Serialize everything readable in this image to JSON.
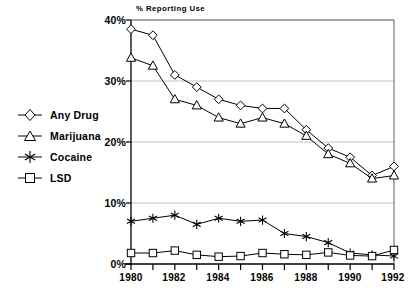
{
  "chart_data": {
    "type": "line",
    "title": "% Reporting Use",
    "xlabel": "",
    "ylabel": "",
    "x": [
      1980,
      1981,
      1982,
      1983,
      1984,
      1985,
      1986,
      1987,
      1988,
      1989,
      1990,
      1991,
      1992
    ],
    "xtick_labels": [
      "1980",
      "1982",
      "1984",
      "1986",
      "1988",
      "1990",
      "1992"
    ],
    "xtick_values": [
      1980,
      1982,
      1984,
      1986,
      1988,
      1990,
      1992
    ],
    "ytick_labels": [
      "0%",
      "10%",
      "20%",
      "30%",
      "40%"
    ],
    "ytick_values": [
      0,
      10,
      20,
      30,
      40
    ],
    "xlim": [
      1980,
      1992
    ],
    "ylim": [
      0,
      40
    ],
    "grid": true,
    "legend_position": "left-outside",
    "series": [
      {
        "name": "Any Drug",
        "marker": "diamond",
        "values": [
          38.5,
          37.5,
          31.0,
          29.0,
          27.0,
          26.0,
          25.5,
          25.5,
          22.0,
          19.0,
          17.5,
          14.5,
          16.0
        ]
      },
      {
        "name": "Marijuana",
        "marker": "triangle",
        "values": [
          33.8,
          32.5,
          27.0,
          26.0,
          24.0,
          23.0,
          24.0,
          23.0,
          21.0,
          18.0,
          16.5,
          14.0,
          14.5
        ]
      },
      {
        "name": "Cocaine",
        "marker": "asterisk",
        "values": [
          7.0,
          7.5,
          8.0,
          6.5,
          7.5,
          7.0,
          7.2,
          5.0,
          4.5,
          3.5,
          1.8,
          1.5,
          1.3
        ]
      },
      {
        "name": "LSD",
        "marker": "square",
        "values": [
          1.8,
          1.8,
          2.2,
          1.5,
          1.2,
          1.3,
          1.8,
          1.6,
          1.5,
          1.9,
          1.4,
          1.3,
          2.3
        ]
      }
    ]
  },
  "legend": {
    "items": [
      {
        "label": "Any Drug"
      },
      {
        "label": "Marijuana"
      },
      {
        "label": "Cocaine"
      },
      {
        "label": "LSD"
      }
    ]
  },
  "axes": {
    "y_labels": [
      "40%",
      "30%",
      "20%",
      "10%",
      "0%"
    ],
    "x_labels": [
      "1980",
      "1982",
      "1984",
      "1986",
      "1988",
      "1990",
      "1992"
    ]
  },
  "colors": {
    "line": "#000000",
    "grid": "#b4b4b4",
    "frame": "#6e6e6e",
    "background": "#ffffff"
  }
}
